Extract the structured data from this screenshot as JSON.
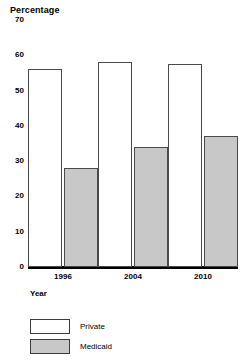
{
  "chart_data": {
    "type": "bar",
    "title": "Percentage",
    "xlabel": "Year",
    "ylabel": "",
    "categories": [
      "1996",
      "2004",
      "2010"
    ],
    "series": [
      {
        "name": "Private",
        "values": [
          56,
          58,
          57.5
        ],
        "color": "#ffffff"
      },
      {
        "name": "Medicaid",
        "values": [
          28,
          34,
          37
        ],
        "color": "#c8c8c8"
      }
    ],
    "ylim": [
      0,
      70
    ],
    "yticks": [
      0,
      10,
      20,
      30,
      40,
      50,
      60,
      70
    ],
    "ytick_labels": [
      "0",
      "10",
      "20",
      "30",
      "40",
      "50",
      "60",
      "70"
    ],
    "grid": false,
    "legend_position": "bottom-left"
  },
  "legend": {
    "entries": [
      {
        "label": "Private",
        "swatch": "white-swatch"
      },
      {
        "label": "Medicaid",
        "swatch": "gray-swatch"
      }
    ]
  }
}
